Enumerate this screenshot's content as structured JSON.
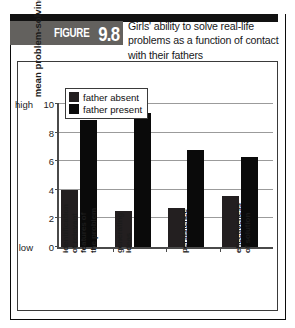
{
  "figure": {
    "tag_word": "FIGURE",
    "tag_number": "9.8",
    "caption": "Girls' ability to solve real-life problems as a function of contact with their fathers"
  },
  "chart_data": {
    "type": "bar",
    "title": "Girls' ability to solve real-life problems as a function of contact with their fathers",
    "xlabel": "",
    "ylabel": "mean problem-solving score",
    "ylim": [
      0,
      10
    ],
    "yticks": [
      0,
      2,
      4,
      6,
      8,
      10
    ],
    "ytick_labels": [
      "0",
      "2",
      "4",
      "6",
      "8",
      "10"
    ],
    "y_low_label": "low",
    "y_high_label": "high",
    "grid": true,
    "grid_axis": "y",
    "legend_position": "upper-left-inside",
    "categories": [
      "identification\nof relevant\nfeatures of\nthe problem",
      "generating\nideas",
      "persistence",
      "effectiveness\nof solution"
    ],
    "categories_flat": [
      "identification of relevant features of the problem",
      "generating ideas",
      "persistence",
      "effectiveness of solution"
    ],
    "series": [
      {
        "name": "father absent",
        "color": "#231f20",
        "values": [
          4.0,
          2.5,
          2.7,
          3.6
        ]
      },
      {
        "name": "father present",
        "color": "#0a0a0a",
        "values": [
          8.9,
          9.4,
          6.8,
          6.3
        ]
      }
    ]
  },
  "legend": {
    "items": [
      {
        "label": "father absent"
      },
      {
        "label": "father present"
      }
    ]
  },
  "colors": {
    "bar_absent": "#231f20",
    "bar_present": "#0a0a0a",
    "band": "#111111",
    "tag_background": "#63615e",
    "axis": "#4a4a4a",
    "grid": "#9b9b9b",
    "frame": "#3a3a3a"
  }
}
